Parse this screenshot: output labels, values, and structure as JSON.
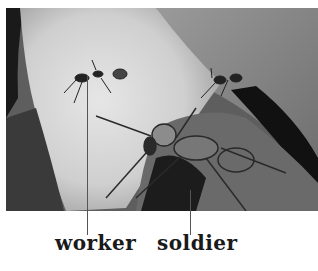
{
  "figure": {
    "labels": [
      {
        "id": "worker",
        "text": "worker"
      },
      {
        "id": "soldier",
        "text": "soldier"
      }
    ]
  }
}
